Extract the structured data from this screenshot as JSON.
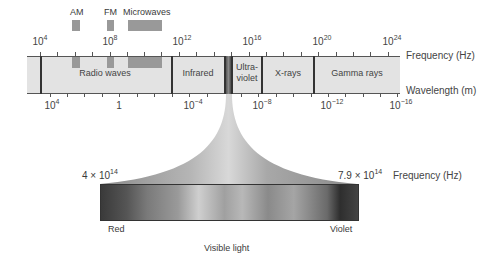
{
  "top_bands": [
    {
      "label": "AM",
      "label_x": 70,
      "box_x": 72,
      "box_w": 8
    },
    {
      "label": "FM",
      "label_x": 104,
      "box_x": 107,
      "box_w": 7
    },
    {
      "label": "Microwaves",
      "label_x": 123,
      "box_x": 128,
      "box_w": 34
    }
  ],
  "frequency_axis": {
    "name": "Frequency (Hz)",
    "labels": [
      {
        "base": "10",
        "exp": "4",
        "x": 40
      },
      {
        "base": "10",
        "exp": "8",
        "x": 110
      },
      {
        "base": "10",
        "exp": "12",
        "x": 179
      },
      {
        "base": "10",
        "exp": "16",
        "x": 249
      },
      {
        "base": "10",
        "exp": "20",
        "x": 318
      },
      {
        "base": "10",
        "exp": "24",
        "x": 388
      }
    ]
  },
  "wavelength_axis": {
    "name": "Wavelength (m)",
    "labels": [
      {
        "base": "10",
        "exp": "4",
        "x": 50
      },
      {
        "base": "1",
        "exp": "",
        "x": 119
      },
      {
        "base": "10",
        "exp": "−4",
        "x": 189
      },
      {
        "base": "10",
        "exp": "−8",
        "x": 258
      },
      {
        "base": "10",
        "exp": "−12",
        "x": 328
      },
      {
        "base": "10",
        "exp": "−16",
        "x": 397
      }
    ]
  },
  "regions": [
    {
      "label": "Radio waves",
      "x": 105
    },
    {
      "label": "Infrared",
      "x": 198
    },
    {
      "label": "Ultra-",
      "label2": "violet",
      "x": 247
    },
    {
      "label": "X-rays",
      "x": 288
    },
    {
      "label": "Gamma rays",
      "x": 357
    }
  ],
  "visible": {
    "low_freq": "4 × 10",
    "low_exp": "14",
    "high_freq": "7.9 × 10",
    "high_exp": "14",
    "axis_name": "Frequency (Hz)",
    "red_label": "Red",
    "violet_label": "Violet",
    "caption": "Visible light"
  },
  "colors": {
    "band_bg": "#e3e3e3",
    "band_box": "#999999",
    "divider": "#333333"
  }
}
